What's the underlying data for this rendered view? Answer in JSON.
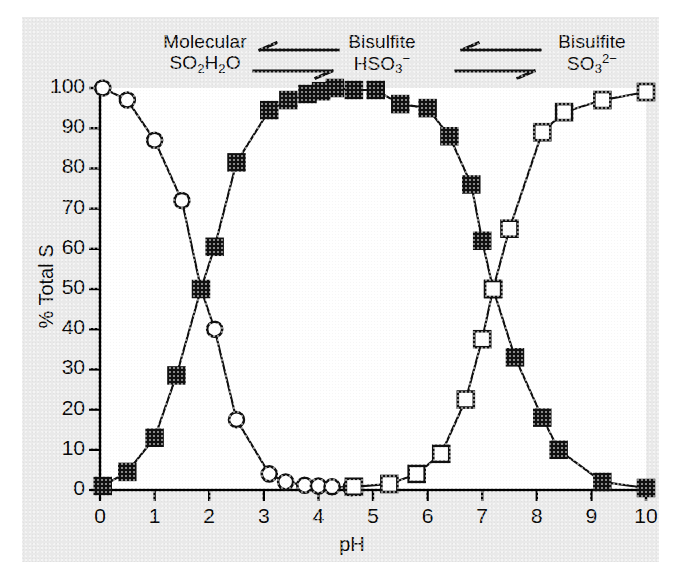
{
  "figure": {
    "background_color": "#e9e9e9",
    "plot_background_color": "#ffffff",
    "axis_color": "#000000",
    "series_color": "#111111"
  },
  "axes": {
    "x": {
      "label": "pH",
      "ticks": [
        "0",
        "1",
        "2",
        "3",
        "4",
        "5",
        "6",
        "7",
        "8",
        "9",
        "10"
      ],
      "min": 0,
      "max": 10
    },
    "y": {
      "label": "% Total S",
      "ticks": [
        "0",
        "10",
        "20",
        "30",
        "40",
        "50",
        "60",
        "70",
        "80",
        "90",
        "100"
      ],
      "min": 0,
      "max": 100
    }
  },
  "annotations": {
    "left": {
      "line1": "Molecular",
      "formula_pre": "SO",
      "formula_sub1": "2",
      "formula_mid": "H",
      "formula_sub2": "2",
      "formula_post": "O"
    },
    "middle": {
      "line1": "Bisulfite",
      "formula_pre": "HSO",
      "formula_sub1": "3",
      "formula_sup": "−"
    },
    "right": {
      "line1": "Bisulfite",
      "formula_pre": "SO",
      "formula_sub1": "3",
      "formula_sup": "2−"
    },
    "equilibrium_symbol": "double-arrow-equilibrium"
  },
  "chart_data": {
    "type": "line",
    "title": "",
    "subtitle": "",
    "xlabel": "pH",
    "ylabel": "% Total S",
    "xlim": [
      0,
      10
    ],
    "ylim": [
      0,
      100
    ],
    "grid": false,
    "legend_position": "none",
    "x_ticks": [
      0,
      1,
      2,
      3,
      4,
      5,
      6,
      7,
      8,
      9,
      10
    ],
    "y_ticks": [
      0,
      10,
      20,
      30,
      40,
      50,
      60,
      70,
      80,
      90,
      100
    ],
    "series": [
      {
        "name": "Molecular SO2H2O",
        "marker": "open-circle",
        "points": [
          {
            "x": 0.05,
            "y": 100
          },
          {
            "x": 0.5,
            "y": 97
          },
          {
            "x": 1.0,
            "y": 87
          },
          {
            "x": 1.5,
            "y": 72
          },
          {
            "x": 1.85,
            "y": 50
          },
          {
            "x": 2.1,
            "y": 40
          },
          {
            "x": 2.5,
            "y": 17.5
          },
          {
            "x": 3.1,
            "y": 4
          },
          {
            "x": 3.4,
            "y": 2
          },
          {
            "x": 3.75,
            "y": 1.2
          },
          {
            "x": 4.0,
            "y": 1
          },
          {
            "x": 4.25,
            "y": 0.8
          },
          {
            "x": 4.6,
            "y": 0.6
          }
        ]
      },
      {
        "name": "Bisulfite HSO3-",
        "marker": "filled-square",
        "points": [
          {
            "x": 0.05,
            "y": 1
          },
          {
            "x": 0.5,
            "y": 4.5
          },
          {
            "x": 1.0,
            "y": 13
          },
          {
            "x": 1.4,
            "y": 28.5
          },
          {
            "x": 1.85,
            "y": 50
          },
          {
            "x": 2.1,
            "y": 60.5
          },
          {
            "x": 2.5,
            "y": 81.5
          },
          {
            "x": 3.1,
            "y": 94.5
          },
          {
            "x": 3.45,
            "y": 97
          },
          {
            "x": 3.8,
            "y": 98.5
          },
          {
            "x": 4.05,
            "y": 99.2
          },
          {
            "x": 4.3,
            "y": 100
          },
          {
            "x": 4.65,
            "y": 99.5
          },
          {
            "x": 5.05,
            "y": 99.5
          },
          {
            "x": 5.5,
            "y": 96
          },
          {
            "x": 6.0,
            "y": 95
          },
          {
            "x": 6.4,
            "y": 88
          },
          {
            "x": 6.8,
            "y": 76
          },
          {
            "x": 7.0,
            "y": 62
          },
          {
            "x": 7.2,
            "y": 50
          },
          {
            "x": 7.6,
            "y": 33
          },
          {
            "x": 8.1,
            "y": 18
          },
          {
            "x": 8.4,
            "y": 10
          },
          {
            "x": 9.2,
            "y": 2
          },
          {
            "x": 10.0,
            "y": 0.5
          }
        ]
      },
      {
        "name": "Bisulfite SO32-",
        "marker": "open-square",
        "points": [
          {
            "x": 4.65,
            "y": 0.8
          },
          {
            "x": 5.3,
            "y": 1.5
          },
          {
            "x": 5.8,
            "y": 4
          },
          {
            "x": 6.25,
            "y": 9
          },
          {
            "x": 6.7,
            "y": 22.5
          },
          {
            "x": 7.0,
            "y": 37.5
          },
          {
            "x": 7.2,
            "y": 50
          },
          {
            "x": 7.5,
            "y": 65
          },
          {
            "x": 8.1,
            "y": 89
          },
          {
            "x": 8.5,
            "y": 94
          },
          {
            "x": 9.2,
            "y": 97
          },
          {
            "x": 10.0,
            "y": 99
          }
        ]
      }
    ]
  }
}
